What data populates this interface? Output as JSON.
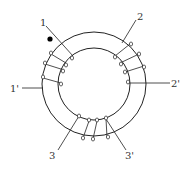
{
  "diagram": {
    "core": {
      "cx": 94,
      "cy": 84,
      "outer_r": 52,
      "inner_r": 36,
      "stroke": "#222222"
    },
    "polarity_dot": {
      "x": 50,
      "y": 39,
      "r": 2.6,
      "color": "#000000"
    },
    "windings": [
      {
        "name": "winding-1",
        "start_label": "1",
        "end_label": "1'",
        "turns": 3
      },
      {
        "name": "winding-2",
        "start_label": "2",
        "end_label": "2'",
        "turns": 3
      },
      {
        "name": "winding-3",
        "start_label": "3",
        "end_label": "3'",
        "turns": 3
      }
    ],
    "labels": {
      "t1": "1",
      "t1p": "1'",
      "t2": "2",
      "t2p": "2'",
      "t3": "3",
      "t3p": "3'"
    }
  }
}
